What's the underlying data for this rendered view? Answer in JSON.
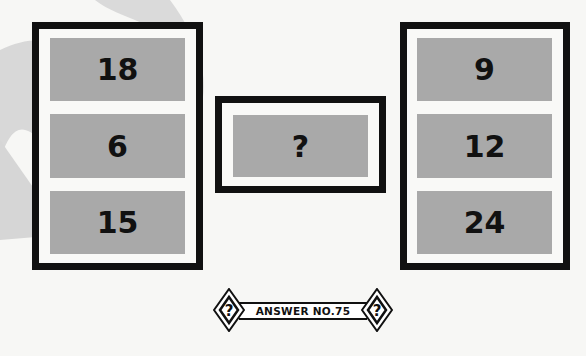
{
  "puzzle": {
    "left_column": [
      "18",
      "6",
      "15"
    ],
    "middle": "?",
    "right_column": [
      "9",
      "12",
      "24"
    ]
  },
  "badge": {
    "label": "ANSWER NO.75",
    "left_icon": "question-diamond-icon",
    "right_icon": "question-diamond-icon",
    "icon_glyph": "?"
  },
  "colors": {
    "border": "#111111",
    "cell": "#a9a9a9",
    "background": "#f7f7f5",
    "watermark": "#d9d9d9"
  }
}
